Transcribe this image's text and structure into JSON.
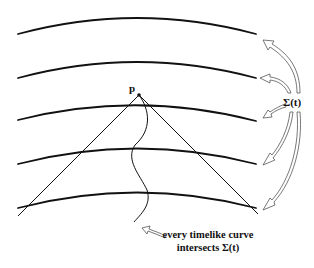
{
  "diagram": {
    "point_label": "p",
    "sigma_label": "Σ(t)",
    "caption_line1": "every timelike curve",
    "caption_line2": "intersects Σ(t)",
    "colors": {
      "stroke": "#111111",
      "background": "#ffffff"
    },
    "hypersurfaces": [
      {
        "left_y": 34,
        "peak_y": 18,
        "right_y": 34
      },
      {
        "left_y": 78,
        "peak_y": 62,
        "right_y": 78
      },
      {
        "left_y": 120,
        "peak_y": 106,
        "right_y": 121
      },
      {
        "left_y": 164,
        "peak_y": 149,
        "right_y": 164
      },
      {
        "left_y": 208,
        "peak_y": 193,
        "right_y": 208
      }
    ]
  }
}
